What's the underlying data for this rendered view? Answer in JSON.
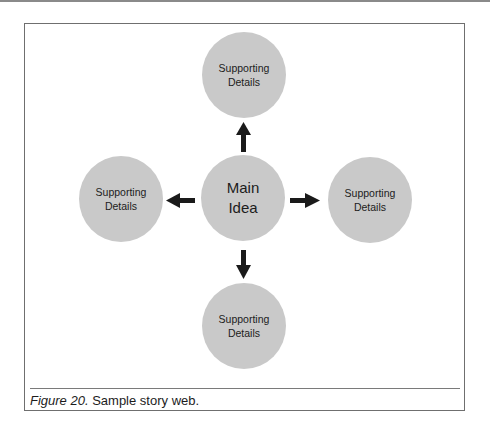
{
  "diagram": {
    "type": "story-web",
    "center": {
      "line1": "Main",
      "line2": "Idea"
    },
    "nodes": [
      {
        "position": "top",
        "line1": "Supporting",
        "line2": "Details"
      },
      {
        "position": "left",
        "line1": "Supporting",
        "line2": "Details"
      },
      {
        "position": "right",
        "line1": "Supporting",
        "line2": "Details"
      },
      {
        "position": "bottom",
        "line1": "Supporting",
        "line2": "Details"
      }
    ],
    "colors": {
      "circle_fill": "#c9c9c9",
      "arrow": "#1a1a1a",
      "border": "#6f6f6f"
    }
  },
  "caption": {
    "label": "Figure 20.",
    "text": " Sample story web."
  }
}
